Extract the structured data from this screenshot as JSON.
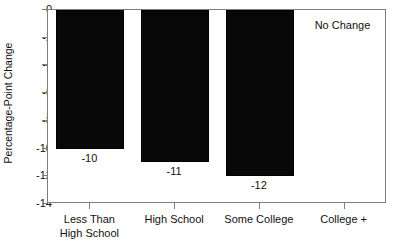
{
  "chart_data": {
    "type": "bar",
    "title": "",
    "xlabel": "",
    "ylabel": "Percentage-Point Change",
    "categories": [
      "Less Than\nHigh School",
      "High School",
      "Some College",
      "College +"
    ],
    "values": [
      -10,
      -11,
      -12,
      null
    ],
    "data_labels": [
      "-10",
      "-11",
      "-12",
      ""
    ],
    "ylim": [
      -14,
      0
    ],
    "y_ticks": [
      0,
      -2,
      -4,
      -6,
      -8,
      -10,
      -12,
      -14
    ],
    "y_tick_labels": [
      "0",
      "-2",
      "-4",
      "-6",
      "-8",
      "-10",
      "-12",
      "-14"
    ],
    "grid": false,
    "legend": "none",
    "annotations": [
      {
        "text": "No Change",
        "category": "College +",
        "position": "top-right"
      }
    ],
    "bar_color": "#080808",
    "axis_color": "#7d7d7d",
    "text_color": "#111111"
  },
  "axis": {
    "y_title": "Percentage-Point Change"
  }
}
